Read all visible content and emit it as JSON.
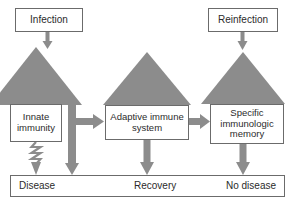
{
  "diagram": {
    "colors": {
      "triangle_fill": "#8c8c8c",
      "arrow_fill": "#8c8c8c",
      "box_border": "#6b6b6b",
      "box_fill": "#ffffff",
      "text": "#2b2b2b",
      "background": "#ffffff"
    },
    "nodes": {
      "infection": {
        "label": "Infection"
      },
      "reinfection": {
        "label": "Reinfection"
      },
      "innate_immunity": {
        "line1": "Innate",
        "line2": "immunity"
      },
      "adaptive_immune_system": {
        "line1": "Adaptive immune",
        "line2": "system"
      },
      "specific_memory": {
        "line1": "Specific",
        "line2": "immunologic",
        "line3": "memory"
      }
    },
    "outcomes": {
      "disease": "Disease",
      "recovery": "Recovery",
      "no_disease": "No disease"
    },
    "connectors": [
      {
        "name": "infection-to-triangle",
        "from": "infection",
        "to": "left-triangle",
        "style": "solid-arrow-down"
      },
      {
        "name": "innate-to-adaptive",
        "from": "innate_immunity",
        "to": "adaptive_immune_system",
        "style": "solid-arrow-right"
      },
      {
        "name": "innate-to-disease",
        "from": "innate_immunity",
        "to": "disease",
        "style": "squiggly-arrow-down"
      },
      {
        "name": "left-triangle-to-disease",
        "from": "left-triangle",
        "to": "disease",
        "style": "solid-arrow-down"
      },
      {
        "name": "adaptive-to-recovery",
        "from": "adaptive_immune_system",
        "to": "recovery",
        "style": "solid-arrow-down"
      },
      {
        "name": "adaptive-to-specific",
        "from": "adaptive_immune_system",
        "to": "specific_memory",
        "style": "solid-arrow-right"
      },
      {
        "name": "reinfection-to-triangle",
        "from": "reinfection",
        "to": "right-triangle",
        "style": "solid-arrow-down"
      },
      {
        "name": "specific-to-no-disease",
        "from": "specific_memory",
        "to": "no_disease",
        "style": "solid-arrow-down"
      }
    ],
    "triangles": [
      {
        "name": "left-triangle",
        "apex_x": 36,
        "apex_y": 47,
        "base_y": 105,
        "half_width": 46
      },
      {
        "name": "middle-triangle",
        "apex_x": 147,
        "apex_y": 52,
        "base_y": 105,
        "half_width": 44
      },
      {
        "name": "right-triangle",
        "apex_x": 243,
        "apex_y": 52,
        "base_y": 104,
        "half_width": 42
      }
    ]
  }
}
